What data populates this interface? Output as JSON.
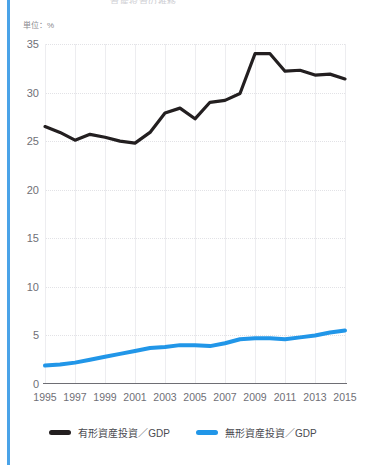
{
  "accent_color": "#4aa3e8",
  "title": "資産投資の推移",
  "unit_label": "単位：%",
  "legend": {
    "items": [
      {
        "label": "有形資産投資／GDP",
        "color": "#231f20",
        "key": "tangible"
      },
      {
        "label": "無形資産投資／GDP",
        "color": "#2196e8",
        "key": "intangible"
      }
    ]
  },
  "chart_data": {
    "type": "line",
    "title": "資産投資の推移",
    "xlabel": "",
    "ylabel": "単位：%",
    "ylim": [
      0,
      35
    ],
    "yticks": [
      0,
      5,
      10,
      15,
      20,
      25,
      30,
      35
    ],
    "ytick_labels": [
      "0",
      "5",
      "10",
      "15",
      "20",
      "25",
      "30",
      "35"
    ],
    "xlim": [
      1995,
      2015
    ],
    "xticks": [
      1995,
      1997,
      1999,
      2001,
      2003,
      2005,
      2007,
      2009,
      2011,
      2013,
      2015
    ],
    "xtick_labels": [
      "1995",
      "1997",
      "1999",
      "2001",
      "2003",
      "2005",
      "2007",
      "2009",
      "2011",
      "2013",
      "2015"
    ],
    "x": [
      1995,
      1996,
      1997,
      1998,
      1999,
      2000,
      2001,
      2002,
      2003,
      2004,
      2005,
      2006,
      2007,
      2008,
      2009,
      2010,
      2011,
      2012,
      2013,
      2014,
      2015
    ],
    "grid": true,
    "grid_horizontal": "dotted",
    "grid_vertical": "solid",
    "legend_position": "bottom",
    "series": [
      {
        "name": "有形資産投資／GDP",
        "key": "tangible",
        "color": "#231f20",
        "width": 3.2,
        "values": [
          26.5,
          25.9,
          25.1,
          25.7,
          25.4,
          25.0,
          24.8,
          25.9,
          27.9,
          28.4,
          27.3,
          29.0,
          29.2,
          29.9,
          34.0,
          34.0,
          32.2,
          32.3,
          31.8,
          31.9,
          31.4
        ]
      },
      {
        "name": "無形資産投資／GDP",
        "key": "intangible",
        "color": "#2196e8",
        "width": 4.0,
        "values": [
          1.9,
          2.0,
          2.2,
          2.5,
          2.8,
          3.1,
          3.4,
          3.7,
          3.8,
          4.0,
          4.0,
          3.9,
          4.2,
          4.6,
          4.7,
          4.7,
          4.6,
          4.8,
          5.0,
          5.3,
          5.5
        ]
      }
    ]
  }
}
